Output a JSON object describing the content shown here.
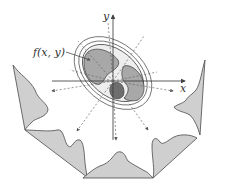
{
  "diagram": {
    "labels": {
      "function": "f(x, y)",
      "x_axis": "x",
      "y_axis": "y"
    },
    "colors": {
      "background": "#ffffff",
      "outline": "#4a4a4a",
      "projection_fill": "#cfcfcf",
      "outer_body_fill": "#eeeeee",
      "organ_fill": "#a8a8a8",
      "dark_organ_fill": "#6e6e6e",
      "axis": "#333333",
      "dashed_ray": "#666666"
    },
    "projections": [
      {
        "name": "left"
      },
      {
        "name": "bottom-left"
      },
      {
        "name": "bottom"
      },
      {
        "name": "bottom-right"
      },
      {
        "name": "right"
      }
    ]
  }
}
